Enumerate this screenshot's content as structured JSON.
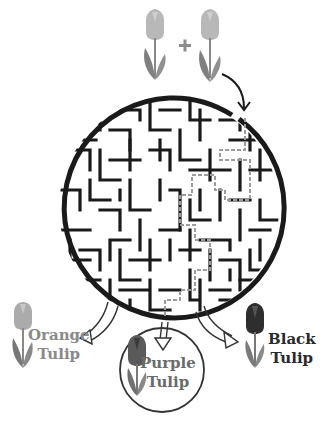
{
  "puzzle": {
    "type": "circular maze",
    "equation": {
      "operand_left": "light tulip",
      "operator": "+",
      "operand_right": "light tulip"
    },
    "entrance": "top-right, arrow from right tulip",
    "solution_path_style": "dashed gray line",
    "exits": [
      {
        "id": "left",
        "label_line1": "Orange",
        "label_line2": "Tulip",
        "color": "#8a8a8a"
      },
      {
        "id": "center",
        "label_line1": "Purple",
        "label_line2": "Tulip",
        "color": "#6a6a6a",
        "highlighted": true
      },
      {
        "id": "right",
        "label_line1": "Black",
        "label_line2": "Tulip",
        "color": "#2a2a2a"
      }
    ]
  },
  "colors": {
    "maze_wall": "#1a1a1a",
    "path": "#9a9a9a",
    "light_petal": "#b5b5b5",
    "light_leaf": "#7d7d7d",
    "orange_petal": "#a8a8a8",
    "purple_petal": "#5c5c5c",
    "black_petal": "#2e2e2e"
  }
}
